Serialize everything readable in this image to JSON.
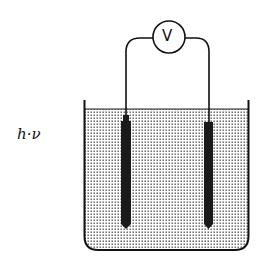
{
  "diagram": {
    "type": "photoelectrochemical cell",
    "light_label": "h·ν",
    "meter_label": "V",
    "components": [
      "voltmeter",
      "left electrode",
      "right electrode",
      "beaker",
      "electrolyte solution",
      "connecting wires"
    ],
    "colors": {
      "line": "#111111",
      "electrode": "#1a1a1a",
      "liquid_dots": "#555555",
      "background": "#ffffff"
    }
  }
}
